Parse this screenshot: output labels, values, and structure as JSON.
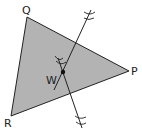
{
  "diagram": {
    "type": "triangle-construction",
    "colors": {
      "fill": "#b3b3b3",
      "stroke": "#222222",
      "background": "#ffffff"
    },
    "vertices": [
      {
        "label": "Q",
        "x": 27,
        "y": 17
      },
      {
        "label": "P",
        "x": 129,
        "y": 71
      },
      {
        "label": "R",
        "x": 11,
        "y": 116
      }
    ],
    "point": {
      "label": "W",
      "x": 63,
      "y": 72
    },
    "labels": {
      "q": "Q",
      "p": "P",
      "r": "R",
      "w": "W"
    },
    "constructions": [
      {
        "name": "bisector-line-1",
        "from": [
          91,
          10
        ],
        "to": [
          54,
          90
        ]
      },
      {
        "name": "bisector-line-2",
        "from": [
          58,
          58
        ],
        "to": [
          82,
          128
        ]
      }
    ]
  }
}
